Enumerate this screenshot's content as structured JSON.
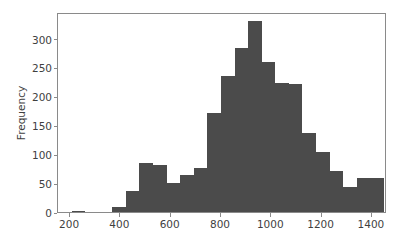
{
  "chart_data": {
    "type": "bar",
    "subtype": "histogram",
    "title": "",
    "xlabel": "",
    "ylabel": "Frequency",
    "grid": false,
    "legend": null,
    "bar_color": "#4b4b4b",
    "axes_color": "#8a8a8a",
    "tick_label_color": "#3f3f3f",
    "background_color": "#ffffff",
    "xlim": [
      152,
      1460
    ],
    "ylim": [
      0,
      346
    ],
    "xticks": [
      200,
      400,
      600,
      800,
      1000,
      1200,
      1400
    ],
    "xtick_labels": [
      "200",
      "400",
      "600",
      "800",
      "1000",
      "1200",
      "1400"
    ],
    "yticks": [
      0,
      50,
      100,
      150,
      200,
      250,
      300
    ],
    "ytick_labels": [
      "0",
      "50",
      "100",
      "150",
      "200",
      "250",
      "300"
    ],
    "bin_width": 54,
    "bin_starts": [
      206,
      260,
      314,
      368,
      422,
      476,
      530,
      584,
      638,
      692,
      746,
      800,
      854,
      908,
      962,
      1016,
      1070,
      1124,
      1178,
      1232,
      1286,
      1340,
      1394
    ],
    "bin_centers": [
      233,
      287,
      341,
      395,
      449,
      503,
      557,
      611,
      665,
      719,
      773,
      827,
      881,
      935,
      989,
      1043,
      1097,
      1151,
      1205,
      1259,
      1313,
      1367,
      1421
    ],
    "values": [
      2,
      0,
      0,
      9,
      37,
      84,
      81,
      51,
      64,
      76,
      172,
      236,
      284,
      331,
      260,
      223,
      222,
      137,
      103,
      71,
      43,
      58,
      59
    ],
    "bars": [
      {
        "start": 206,
        "end": 260,
        "center": 233,
        "value": 2
      },
      {
        "start": 260,
        "end": 314,
        "center": 287,
        "value": 0
      },
      {
        "start": 314,
        "end": 368,
        "center": 341,
        "value": 0
      },
      {
        "start": 368,
        "end": 422,
        "center": 395,
        "value": 9
      },
      {
        "start": 422,
        "end": 476,
        "center": 449,
        "value": 37
      },
      {
        "start": 476,
        "end": 530,
        "center": 503,
        "value": 84
      },
      {
        "start": 530,
        "end": 584,
        "center": 557,
        "value": 81
      },
      {
        "start": 584,
        "end": 638,
        "center": 611,
        "value": 51
      },
      {
        "start": 638,
        "end": 692,
        "center": 665,
        "value": 64
      },
      {
        "start": 692,
        "end": 746,
        "center": 719,
        "value": 76
      },
      {
        "start": 746,
        "end": 800,
        "center": 773,
        "value": 172
      },
      {
        "start": 800,
        "end": 854,
        "center": 827,
        "value": 236
      },
      {
        "start": 854,
        "end": 908,
        "center": 881,
        "value": 284
      },
      {
        "start": 908,
        "end": 962,
        "center": 935,
        "value": 331
      },
      {
        "start": 962,
        "end": 1016,
        "center": 989,
        "value": 260
      },
      {
        "start": 1016,
        "end": 1070,
        "center": 1043,
        "value": 223
      },
      {
        "start": 1070,
        "end": 1124,
        "center": 1097,
        "value": 222
      },
      {
        "start": 1124,
        "end": 1178,
        "center": 1151,
        "value": 137
      },
      {
        "start": 1178,
        "end": 1232,
        "center": 1205,
        "value": 103
      },
      {
        "start": 1232,
        "end": 1286,
        "center": 1259,
        "value": 71
      },
      {
        "start": 1286,
        "end": 1340,
        "center": 1313,
        "value": 43
      },
      {
        "start": 1340,
        "end": 1394,
        "center": 1367,
        "value": 58
      },
      {
        "start": 1394,
        "end": 1448,
        "center": 1421,
        "value": 59
      }
    ]
  }
}
